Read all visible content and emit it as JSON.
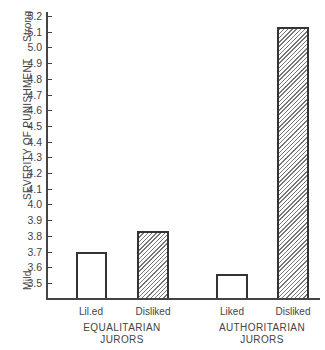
{
  "chart_data": {
    "type": "bar",
    "title": "",
    "ylabel": "SEVERITY OF PUNISHMENT",
    "ylabel_low": "Mild",
    "ylabel_high": "Strong",
    "xlabel": "",
    "ylim": [
      3.4,
      5.2
    ],
    "yticks": [
      "5.2",
      "5.1",
      "5.0",
      "4.9",
      "4.8",
      "4.7",
      "4.6",
      "4.5",
      "4.4",
      "4.3",
      "4.2",
      "4.1",
      "4.0",
      "3.9",
      "3.8",
      "3.7",
      "3.6",
      "3.5"
    ],
    "groups": [
      {
        "label_line1": "EQUALITARIAN",
        "label_line2": "JURORS",
        "bars": [
          {
            "label": "Lil.ed",
            "value": 3.7,
            "pattern": "plain"
          },
          {
            "label": "Disliked",
            "value": 3.83,
            "pattern": "hatched"
          }
        ]
      },
      {
        "label_line1": "AUTHORITARIAN",
        "label_line2": "JURORS",
        "bars": [
          {
            "label": "Liked",
            "value": 3.56,
            "pattern": "plain"
          },
          {
            "label": "Disliked",
            "value": 5.13,
            "pattern": "hatched"
          }
        ]
      }
    ],
    "categories": [
      "Equalitarian Liked",
      "Equalitarian Disliked",
      "Authoritarian Liked",
      "Authoritarian Disliked"
    ],
    "series": [
      {
        "name": "Severity of punishment",
        "values": [
          3.7,
          3.83,
          3.56,
          5.13
        ]
      }
    ],
    "grid": false,
    "legend": "none"
  }
}
